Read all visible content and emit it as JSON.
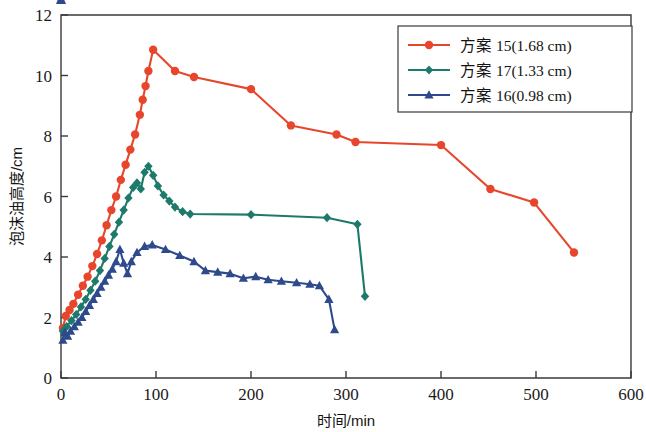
{
  "chart_data": {
    "type": "line",
    "title": "",
    "xlabel": "时间/min",
    "ylabel": "泡沫油高度/cm",
    "xlim": [
      0,
      600
    ],
    "ylim": [
      0,
      12
    ],
    "xticks": [
      0,
      100,
      200,
      300,
      400,
      500,
      600
    ],
    "yticks": [
      0,
      2,
      4,
      6,
      8,
      10,
      12
    ],
    "grid": false,
    "legend_position": "top-right",
    "series": [
      {
        "name": "方案 15(1.68 cm)",
        "color": "#E8462C",
        "marker": "circle",
        "points": [
          [
            2,
            1.65
          ],
          [
            5,
            2.05
          ],
          [
            9,
            2.25
          ],
          [
            13,
            2.45
          ],
          [
            18,
            2.75
          ],
          [
            23,
            3.05
          ],
          [
            28,
            3.35
          ],
          [
            33,
            3.7
          ],
          [
            38,
            4.1
          ],
          [
            43,
            4.55
          ],
          [
            48,
            5.05
          ],
          [
            53,
            5.55
          ],
          [
            58,
            6.0
          ],
          [
            63,
            6.55
          ],
          [
            68,
            7.05
          ],
          [
            73,
            7.55
          ],
          [
            78,
            8.05
          ],
          [
            83,
            8.7
          ],
          [
            86,
            9.2
          ],
          [
            89,
            9.65
          ],
          [
            92,
            10.15
          ],
          [
            97,
            10.85
          ],
          [
            120,
            10.15
          ],
          [
            140,
            9.95
          ],
          [
            200,
            9.55
          ],
          [
            242,
            8.35
          ],
          [
            290,
            8.05
          ],
          [
            310,
            7.8
          ],
          [
            400,
            7.7
          ],
          [
            452,
            6.25
          ],
          [
            498,
            5.8
          ],
          [
            540,
            4.15
          ]
        ]
      },
      {
        "name": "方案 17(1.33 cm)",
        "color": "#1D7A6B",
        "marker": "diamond",
        "points": [
          [
            2,
            1.55
          ],
          [
            6,
            1.7
          ],
          [
            11,
            1.9
          ],
          [
            16,
            2.1
          ],
          [
            21,
            2.35
          ],
          [
            26,
            2.6
          ],
          [
            31,
            2.9
          ],
          [
            36,
            3.2
          ],
          [
            41,
            3.55
          ],
          [
            46,
            3.95
          ],
          [
            51,
            4.35
          ],
          [
            56,
            4.75
          ],
          [
            61,
            5.15
          ],
          [
            66,
            5.55
          ],
          [
            71,
            5.95
          ],
          [
            76,
            6.3
          ],
          [
            80,
            6.45
          ],
          [
            84,
            6.25
          ],
          [
            88,
            6.8
          ],
          [
            92,
            7.0
          ],
          [
            97,
            6.7
          ],
          [
            102,
            6.35
          ],
          [
            108,
            6.05
          ],
          [
            114,
            5.85
          ],
          [
            120,
            5.65
          ],
          [
            128,
            5.5
          ],
          [
            136,
            5.42
          ],
          [
            200,
            5.4
          ],
          [
            280,
            5.3
          ],
          [
            312,
            5.08
          ],
          [
            320,
            2.7
          ]
        ]
      },
      {
        "name": "方案 16(0.98 cm)",
        "color": "#2E4A8C",
        "marker": "triangle",
        "points": [
          [
            2,
            1.25
          ],
          [
            4,
            1.5
          ],
          [
            7,
            1.38
          ],
          [
            10,
            1.55
          ],
          [
            14,
            1.7
          ],
          [
            18,
            1.85
          ],
          [
            22,
            2.0
          ],
          [
            26,
            2.2
          ],
          [
            30,
            2.4
          ],
          [
            34,
            2.6
          ],
          [
            38,
            2.8
          ],
          [
            42,
            3.0
          ],
          [
            46,
            3.2
          ],
          [
            50,
            3.4
          ],
          [
            54,
            3.6
          ],
          [
            58,
            3.85
          ],
          [
            62,
            4.25
          ],
          [
            66,
            3.8
          ],
          [
            70,
            3.45
          ],
          [
            74,
            3.85
          ],
          [
            80,
            4.15
          ],
          [
            88,
            4.35
          ],
          [
            96,
            4.4
          ],
          [
            110,
            4.25
          ],
          [
            125,
            4.05
          ],
          [
            140,
            3.85
          ],
          [
            152,
            3.55
          ],
          [
            165,
            3.5
          ],
          [
            178,
            3.45
          ],
          [
            192,
            3.3
          ],
          [
            205,
            3.35
          ],
          [
            218,
            3.25
          ],
          [
            232,
            3.2
          ],
          [
            248,
            3.15
          ],
          [
            262,
            3.1
          ],
          [
            272,
            3.05
          ],
          [
            282,
            2.6
          ],
          [
            288,
            1.6
          ]
        ]
      }
    ]
  },
  "axes": {
    "x_tick_labels": [
      "0",
      "100",
      "200",
      "300",
      "400",
      "500",
      "600"
    ],
    "y_tick_labels": [
      "0",
      "2",
      "4",
      "6",
      "8",
      "10",
      "12"
    ],
    "x_title": "时间/min",
    "y_title": "泡沫油高度/cm"
  },
  "legend": {
    "entries": [
      {
        "label": "方案 15(1.68 cm)",
        "color": "#E8462C",
        "marker": "circle"
      },
      {
        "label": "方案 17(1.33 cm)",
        "color": "#1D7A6B",
        "marker": "diamond"
      },
      {
        "label": "方案 16(0.98 cm)",
        "color": "#2E4A8C",
        "marker": "triangle"
      }
    ]
  }
}
